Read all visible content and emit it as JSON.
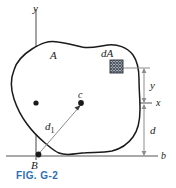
{
  "figure": {
    "caption": "FIG. G-2",
    "caption_color": "#2d6fb5",
    "labels": {
      "y_axis": "y",
      "x_axis": "x",
      "b_axis": "b",
      "area": "A",
      "element_area": "dA",
      "centroid": "c",
      "point_b": "B",
      "dim_y": "y",
      "dim_d": "d",
      "dist_d1": "d",
      "dist_d1_sub": "1"
    },
    "colors": {
      "outline": "#1a1a1a",
      "axis": "#8c8c8c",
      "dimension": "#8c8c8c",
      "marker": "#1a1a1a",
      "hatch": "#555f6b"
    }
  }
}
